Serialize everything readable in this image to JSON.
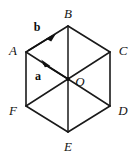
{
  "figure": {
    "type": "geometry-diagram",
    "shape": "regular-hexagon",
    "width": 138,
    "height": 158,
    "background_color": "#ffffff",
    "stroke_color": "#1a1a1a",
    "label_color": "#141414",
    "stroke_width": 1.6,
    "center": {
      "name": "O",
      "x": 68,
      "y": 79
    },
    "vertices": [
      {
        "name": "A",
        "x": 26,
        "y": 52,
        "label_x": 13,
        "label_y": 50
      },
      {
        "name": "B",
        "x": 68,
        "y": 26,
        "label_x": 68,
        "label_y": 13
      },
      {
        "name": "C",
        "x": 110,
        "y": 52,
        "label_x": 123,
        "label_y": 50
      },
      {
        "name": "D",
        "x": 110,
        "y": 106,
        "label_x": 123,
        "label_y": 110
      },
      {
        "name": "E",
        "x": 68,
        "y": 132,
        "label_x": 68,
        "label_y": 146
      },
      {
        "name": "F",
        "x": 26,
        "y": 106,
        "label_x": 13,
        "label_y": 110
      }
    ],
    "center_label": {
      "name": "O",
      "x": 80,
      "y": 81
    },
    "edges": [
      {
        "from": "A",
        "to": "B"
      },
      {
        "from": "B",
        "to": "C"
      },
      {
        "from": "C",
        "to": "D"
      },
      {
        "from": "D",
        "to": "E"
      },
      {
        "from": "E",
        "to": "F"
      },
      {
        "from": "F",
        "to": "A"
      }
    ],
    "diagonals": [
      {
        "from": "A",
        "to": "D"
      },
      {
        "from": "B",
        "to": "E"
      },
      {
        "from": "C",
        "to": "F"
      }
    ],
    "vectors": [
      {
        "name": "a",
        "label": "a",
        "from": "O",
        "to": "A",
        "arrow_tip_x": 42,
        "arrow_tip_y": 60,
        "label_x": 38,
        "label_y": 76
      },
      {
        "name": "b",
        "label": "b",
        "from": "A",
        "to": "B",
        "arrow_tip_x": 54,
        "arrow_tip_y": 35,
        "label_x": 37,
        "label_y": 27
      }
    ]
  }
}
